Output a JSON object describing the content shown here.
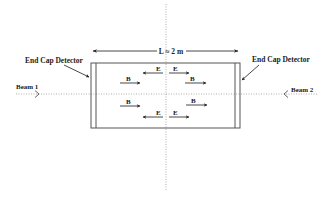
{
  "diagram": {
    "title": "",
    "dimension": {
      "label": "L ≈ 2 m"
    },
    "detectors": {
      "left": {
        "label": "End Cap Detector"
      },
      "right": {
        "label": "End Cap Detector"
      }
    },
    "beams": {
      "left": {
        "label": "Beam 1"
      },
      "right": {
        "label": "Beam 2"
      }
    },
    "field_labels": {
      "top_left_E": "E",
      "top_right_E": "E",
      "upper_left_B": "B",
      "upper_right_B": "B",
      "lower_left_B": "B",
      "lower_right_B": "B",
      "bottom_left_E": "E",
      "bottom_right_E": "E"
    },
    "colors": {
      "line": "#444444",
      "dotted": "#9a9a9a",
      "text": "#222222",
      "background": "#ffffff"
    }
  }
}
